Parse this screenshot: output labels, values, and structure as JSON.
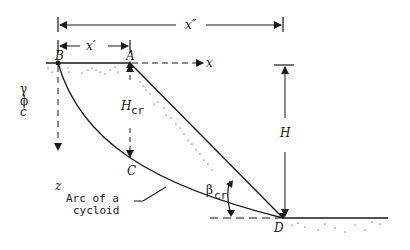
{
  "diagram": {
    "points": {
      "B": "B",
      "A": "A",
      "C": "C",
      "D": "D"
    },
    "dimensions": {
      "x_double_prime": "x″",
      "x_prime": "x′",
      "H": "H",
      "H_cr_main": "H",
      "H_cr_sub": "cr",
      "beta_main": "β",
      "beta_sub": "cr"
    },
    "axes": {
      "x": "x",
      "z": "z"
    },
    "soil_params": {
      "gamma": "γ",
      "phi": "ϕ",
      "c": "c"
    },
    "annotation": {
      "line1": "Arc of a",
      "line2": "cycloid"
    },
    "colors": {
      "ink": "#1a1a1a",
      "background": "#ffffff"
    }
  }
}
